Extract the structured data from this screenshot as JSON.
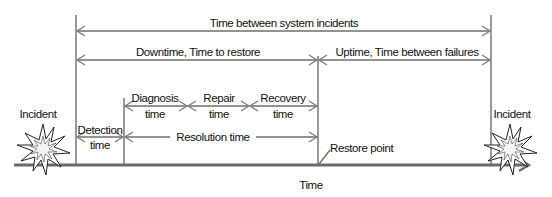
{
  "diagram": {
    "title_top": "Time between system incidents",
    "downtime": "Downtime, Time to restore",
    "uptime": "Uptime, Time between failures",
    "diagnosis": {
      "line1": "Diagnosis",
      "line2": "time"
    },
    "repair": {
      "line1": "Repair",
      "line2": "time"
    },
    "recovery": {
      "line1": "Recovery",
      "line2": "time"
    },
    "detection": {
      "line1": "Detection",
      "line2": "time"
    },
    "resolution": "Resolution time",
    "restore_point": "Restore point",
    "incident_left": "Incident",
    "incident_right": "Incident",
    "axis_label": "Time",
    "icons": [
      "explosion-icon",
      "explosion-icon"
    ],
    "colors": {
      "line": "#6e6e6e",
      "text": "#111111",
      "background": "#ffffff"
    }
  }
}
